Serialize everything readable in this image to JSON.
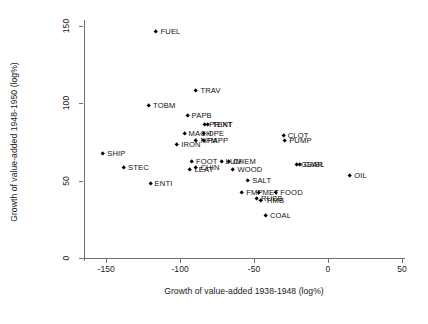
{
  "chart_data": {
    "type": "scatter",
    "title": "",
    "subtitle": "",
    "xlabel": "Growth of value-added 1938-1948 (log%)",
    "ylabel": "Growth of value-added 1948-1950 (log%)",
    "xlim": [
      -165,
      50
    ],
    "ylim": [
      0,
      152
    ],
    "xticks": [
      -150,
      -100,
      -50,
      0,
      50
    ],
    "yticks": [
      0,
      50,
      100,
      150
    ],
    "xtick_labels": [
      "-150",
      "-100",
      "-50",
      "0",
      "50"
    ],
    "ytick_labels": [
      "0",
      "50",
      "100",
      "150"
    ],
    "grid": false,
    "legend": "none",
    "marker": "filled-diamond",
    "marker_color": "#000000",
    "points": [
      {
        "label": "FUEL",
        "x": -116,
        "y": 146,
        "label_pos": "right"
      },
      {
        "label": "TRAV",
        "x": -89,
        "y": 108,
        "label_pos": "right"
      },
      {
        "label": "TOBM",
        "x": -121,
        "y": 98,
        "label_pos": "right"
      },
      {
        "label": "PAPB",
        "x": -95,
        "y": 92,
        "label_pos": "right"
      },
      {
        "label": "PRINT",
        "x": -83,
        "y": 86,
        "label_pos": "right"
      },
      {
        "label": "TEXT",
        "x": -81,
        "y": 86,
        "label_pos": "right"
      },
      {
        "label": "MACH",
        "x": -97,
        "y": 80,
        "label_pos": "right"
      },
      {
        "label": "OPE",
        "x": -84,
        "y": 80,
        "label_pos": "right"
      },
      {
        "label": "NFM",
        "x": -89,
        "y": 76,
        "label_pos": "right"
      },
      {
        "label": "PAPP",
        "x": -84,
        "y": 76,
        "label_pos": "right"
      },
      {
        "label": "IRON",
        "x": -102,
        "y": 73,
        "label_pos": "right"
      },
      {
        "label": "SHIP",
        "x": -152,
        "y": 67,
        "label_pos": "right"
      },
      {
        "label": "CLOT",
        "x": -30,
        "y": 79,
        "label_pos": "right"
      },
      {
        "label": "PUMP",
        "x": -29,
        "y": 76,
        "label_pos": "right"
      },
      {
        "label": "FOOT",
        "x": -92,
        "y": 62,
        "label_pos": "right"
      },
      {
        "label": "LUM",
        "x": -72,
        "y": 62,
        "label_pos": "right"
      },
      {
        "label": "CHEM",
        "x": -67,
        "y": 62,
        "label_pos": "right"
      },
      {
        "label": "LEAT",
        "x": -93,
        "y": 57,
        "label_pos": "right"
      },
      {
        "label": "CHIN",
        "x": -89,
        "y": 58,
        "label_pos": "right"
      },
      {
        "label": "WOOD",
        "x": -64,
        "y": 57,
        "label_pos": "right"
      },
      {
        "label": "GEAR",
        "x": -21,
        "y": 60,
        "label_pos": "right"
      },
      {
        "label": "CABL",
        "x": -19,
        "y": 60,
        "label_pos": "right"
      },
      {
        "label": "STEC",
        "x": -138,
        "y": 58,
        "label_pos": "right"
      },
      {
        "label": "OIL",
        "x": 15,
        "y": 53,
        "label_pos": "right"
      },
      {
        "label": "SALT",
        "x": -54,
        "y": 50,
        "label_pos": "right"
      },
      {
        "label": "ENTI",
        "x": -120,
        "y": 48,
        "label_pos": "right"
      },
      {
        "label": "FMP",
        "x": -58,
        "y": 42,
        "label_pos": "right"
      },
      {
        "label": "MET",
        "x": -47,
        "y": 42,
        "label_pos": "right"
      },
      {
        "label": "FOOD",
        "x": -35,
        "y": 42,
        "label_pos": "right"
      },
      {
        "label": "RUBB",
        "x": -48,
        "y": 38,
        "label_pos": "right"
      },
      {
        "label": "TIMB",
        "x": -45,
        "y": 37,
        "label_pos": "right"
      },
      {
        "label": "COAL",
        "x": -42,
        "y": 27,
        "label_pos": "right"
      }
    ]
  },
  "axis": {
    "x_title": "Growth of value-added 1938-1948 (log%)",
    "y_title": "Growth of value-added 1948-1950 (log%)"
  }
}
